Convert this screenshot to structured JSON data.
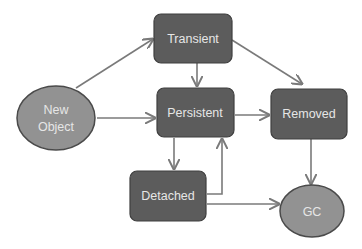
{
  "diagram": {
    "colors": {
      "state_box_fill": "#5c5c5c",
      "terminal_oval_fill": "#929292",
      "edge": "#7a7a7a",
      "label_text": "#e6e6e6",
      "background": "#ffffff"
    },
    "nodes": [
      {
        "id": "new_object",
        "label_line1": "New",
        "label_line2": "Object",
        "shape": "ellipse"
      },
      {
        "id": "transient",
        "label": "Transient",
        "shape": "rounded-rect"
      },
      {
        "id": "persistent",
        "label": "Persistent",
        "shape": "rounded-rect"
      },
      {
        "id": "removed",
        "label": "Removed",
        "shape": "rounded-rect"
      },
      {
        "id": "detached",
        "label": "Detached",
        "shape": "rounded-rect"
      },
      {
        "id": "gc",
        "label": "GC",
        "shape": "ellipse"
      }
    ],
    "edges": [
      {
        "from": "new_object",
        "to": "transient"
      },
      {
        "from": "new_object",
        "to": "persistent"
      },
      {
        "from": "transient",
        "to": "persistent"
      },
      {
        "from": "transient",
        "to": "removed"
      },
      {
        "from": "persistent",
        "to": "removed"
      },
      {
        "from": "persistent",
        "to": "detached"
      },
      {
        "from": "detached",
        "to": "persistent"
      },
      {
        "from": "detached",
        "to": "gc"
      },
      {
        "from": "removed",
        "to": "gc"
      }
    ]
  }
}
